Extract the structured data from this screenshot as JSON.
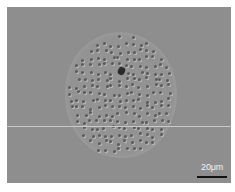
{
  "image": {
    "description": "Grayscale micrograph of a circular particle/cell with dimpled surface texture",
    "background_color": "#8e8e8e",
    "border_color": "#ffffff",
    "features": {
      "disc": {
        "center_x": 120,
        "center_y": 95,
        "width": 112,
        "height": 126
      },
      "dark_spot": {
        "x": 121,
        "y": 70
      },
      "horizontal_artifact_line_y": 126
    }
  },
  "scale_bar": {
    "label": "20μm",
    "bar_color": "#111111",
    "label_color": "#f2f2f2"
  }
}
